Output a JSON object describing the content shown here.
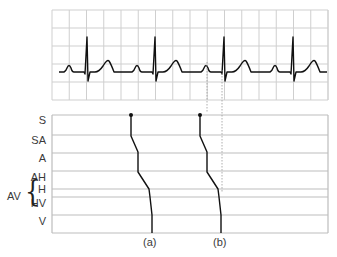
{
  "ecg": {
    "grid": {
      "x0": 52,
      "x1": 328,
      "y0": 10,
      "y1": 100,
      "col_step": 17.25,
      "rows": [
        10,
        28,
        46,
        64,
        82,
        100
      ],
      "color": "#cfcfcf"
    },
    "baseline_y": 72,
    "beats_r_peak_x": [
      87,
      155,
      224,
      293
    ],
    "trace_color": "#111111"
  },
  "ladder": {
    "x0": 52,
    "x1": 328,
    "line_color": "#bdbdbd",
    "lines_y": [
      115,
      135,
      153,
      171,
      189,
      197,
      215,
      233
    ],
    "labels": [
      {
        "text": "S",
        "y": 120
      },
      {
        "text": "SA",
        "y": 140
      },
      {
        "text": "A",
        "y": 158
      },
      {
        "text": "AH",
        "y": 176
      },
      {
        "text": "H",
        "y": 188
      },
      {
        "text": "HV",
        "y": 202
      },
      {
        "text": "V",
        "y": 220
      }
    ],
    "group_label": "AV",
    "traces": [
      {
        "label": "(a)",
        "points": [
          [
            131,
            115
          ],
          [
            131,
            136
          ],
          [
            138,
            152
          ],
          [
            138,
            172
          ],
          [
            149,
            189
          ],
          [
            150,
            197
          ],
          [
            152,
            215
          ],
          [
            152,
            233
          ]
        ]
      },
      {
        "label": "(b)",
        "points": [
          [
            200,
            115
          ],
          [
            200,
            136
          ],
          [
            207,
            152
          ],
          [
            207,
            172
          ],
          [
            218,
            189
          ],
          [
            219,
            197
          ],
          [
            221,
            215
          ],
          [
            221,
            233
          ]
        ]
      }
    ],
    "dotted_guides": [
      {
        "x": 207,
        "y0": 62,
        "y1": 112
      },
      {
        "x": 222,
        "y0": 70,
        "y1": 192
      }
    ]
  }
}
